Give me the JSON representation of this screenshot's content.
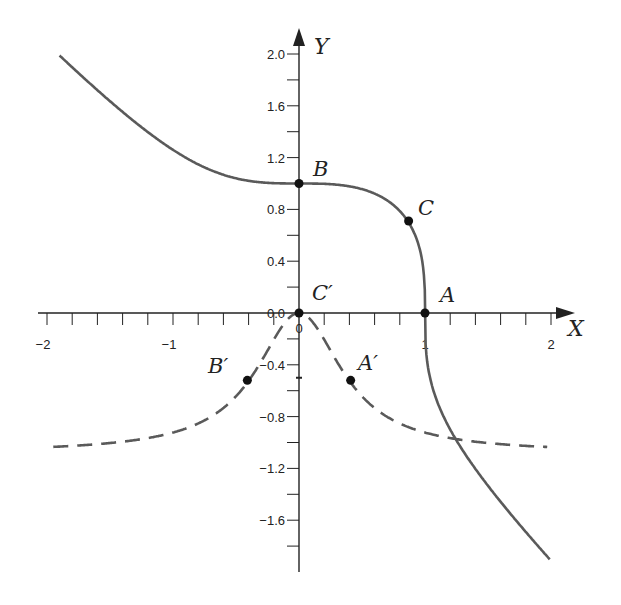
{
  "chart_data": {
    "type": "line",
    "title": "",
    "xlabel": "X",
    "ylabel": "Y",
    "xlim": [
      -2,
      2
    ],
    "ylim": [
      -1.8,
      2.0
    ],
    "grid": false,
    "legend": null,
    "x_ticks": [
      -2,
      -1.8,
      -1.6,
      -1.4,
      -1.2,
      -1,
      -0.8,
      -0.6,
      -0.4,
      -0.2,
      0,
      0.2,
      0.4,
      0.6,
      0.8,
      1,
      1.2,
      1.4,
      1.6,
      1.8,
      2
    ],
    "x_tick_labels": [
      {
        "value": -2,
        "label": "−2"
      },
      {
        "value": -1,
        "label": "−1"
      },
      {
        "value": 0,
        "label": "0"
      },
      {
        "value": 1,
        "label": "1"
      },
      {
        "value": 2,
        "label": "2"
      }
    ],
    "y_ticks": [
      2.0,
      1.8,
      1.6,
      1.4,
      1.2,
      1.0,
      0.8,
      0.6,
      0.4,
      0.2,
      0.0,
      -0.2,
      -0.4,
      -0.6,
      -0.8,
      -1.0,
      -1.2,
      -1.4,
      -1.6,
      -1.8
    ],
    "y_tick_labels": [
      {
        "value": 2.0,
        "label": "2.0"
      },
      {
        "value": 1.6,
        "label": "1.6"
      },
      {
        "value": 1.2,
        "label": "1.2"
      },
      {
        "value": 0.8,
        "label": "0.8"
      },
      {
        "value": 0.4,
        "label": "0.4"
      },
      {
        "value": 0.0,
        "label": "0.0"
      },
      {
        "value": -0.4,
        "label": "−0.4"
      },
      {
        "value": -0.8,
        "label": "−0.8"
      },
      {
        "value": -1.2,
        "label": "−1.2"
      },
      {
        "value": -1.6,
        "label": "−1.6"
      }
    ],
    "series": [
      {
        "name": "solid curve",
        "style": "solid",
        "description": "y = cbrt(1 - x^3)",
        "x": [
          -1.9,
          -1.5,
          -1.0,
          -0.5,
          0.0,
          0.5,
          0.8,
          0.87,
          0.95,
          1.0,
          1.2,
          1.5,
          1.99
        ],
        "values": [
          1.97,
          1.61,
          1.26,
          1.04,
          1.0,
          0.96,
          0.8,
          0.7,
          0.52,
          0.0,
          -0.89,
          -1.33,
          -1.9
        ]
      },
      {
        "name": "dashed curve",
        "style": "dashed",
        "x": [
          -1.95,
          -1.5,
          -1.0,
          -0.6,
          -0.41,
          -0.2,
          0.0,
          0.2,
          0.41,
          0.6,
          1.0,
          1.5,
          1.97
        ],
        "values": [
          -1.09,
          -1.07,
          -0.92,
          -0.73,
          -0.52,
          -0.21,
          0.0,
          -0.21,
          -0.52,
          -0.73,
          -0.92,
          -1.03,
          -1.07
        ]
      }
    ],
    "points": [
      {
        "label": "A",
        "x": 1.0,
        "y": 0.0
      },
      {
        "label": "B",
        "x": 0.0,
        "y": 1.0
      },
      {
        "label": "C",
        "x": 0.87,
        "y": 0.71
      },
      {
        "label": "A′",
        "x": 0.41,
        "y": -0.52
      },
      {
        "label": "B′",
        "x": -0.41,
        "y": -0.52
      },
      {
        "label": "C′",
        "x": 0.0,
        "y": 0.0
      }
    ],
    "annotations": [
      "A",
      "B",
      "C",
      "A′",
      "B′",
      "C′"
    ]
  },
  "labels": {
    "x_axis": "X",
    "y_axis": "Y",
    "A": "A",
    "B": "B",
    "C": "C",
    "A_prime": "A′",
    "B_prime": "B′",
    "C_prime": "C′"
  },
  "colors": {
    "axis": "#222222",
    "curve": "#5a5a5a",
    "point": "#111111"
  }
}
